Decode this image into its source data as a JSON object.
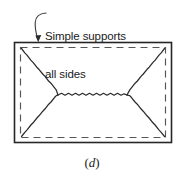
{
  "figure": {
    "caption": "(d)",
    "caption_open_paren": "(",
    "caption_letter": "d",
    "caption_close_paren": ")",
    "annotation": {
      "line1": "Simple supports",
      "line2": "all sides"
    },
    "colors": {
      "ink": "#1a1a1a",
      "outline": "#262626",
      "dashed": "#4d4d4d",
      "background": "#ffffff"
    },
    "plate": {
      "outer_rect": {
        "x": 14,
        "y": 42,
        "width": 158,
        "height": 101
      },
      "support_rect_dashed": {
        "x": 20,
        "y": 47,
        "width": 146,
        "height": 91
      },
      "yield_line_nodes": [
        {
          "name": "left-node",
          "x": 58,
          "y": 95
        },
        {
          "name": "right-node",
          "x": 127,
          "y": 95
        }
      ],
      "yield_line_corners": [
        {
          "name": "top-left",
          "x": 21,
          "y": 48
        },
        {
          "name": "top-right",
          "x": 165,
          "y": 48
        },
        {
          "name": "bottom-right",
          "x": 165,
          "y": 137
        },
        {
          "name": "bottom-left",
          "x": 21,
          "y": 137
        }
      ]
    },
    "leader": {
      "tip": {
        "x": 38,
        "y": 42
      },
      "tail": {
        "x": 46,
        "y": 13
      }
    }
  }
}
